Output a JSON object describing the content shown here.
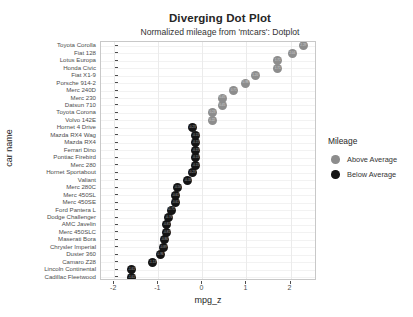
{
  "chart_data": {
    "type": "scatter",
    "title": "Diverging Dot Plot",
    "subtitle": "Normalized mileage from 'mtcars': Dotplot",
    "xlabel": "mpg_z",
    "ylabel": "car name",
    "xlim": [
      -2.3,
      2.6
    ],
    "grid": true,
    "legend": {
      "title": "Mileage",
      "position": "right",
      "entries": [
        {
          "label": "Above Average",
          "color": "#8d8d8d",
          "key": "above"
        },
        {
          "label": "Below Average",
          "color": "#141414",
          "key": "below"
        }
      ]
    },
    "xticks": [
      -2,
      -1,
      0,
      1,
      2
    ],
    "xtick_labels": [
      "-2",
      "-1",
      "0",
      "1",
      "2"
    ],
    "categories": [
      "Cadillac Fleetwood",
      "Lincoln Continental",
      "Camaro Z28",
      "Duster 360",
      "Chrysler Imperial",
      "Maserati Bora",
      "Merc 450SLC",
      "AMC Javelin",
      "Dodge Challenger",
      "Ford Pantera L",
      "Merc 450SE",
      "Merc 450SL",
      "Merc 280C",
      "Valiant",
      "Hornet Sportabout",
      "Merc 280",
      "Pontiac Firebird",
      "Ferrari Dino",
      "Mazda RX4",
      "Mazda RX4 Wag",
      "Hornet 4 Drive",
      "Volvo 142E",
      "Toyota Corona",
      "Datsun 710",
      "Merc 230",
      "Merc 240D",
      "Porsche 914-2",
      "Fiat X1-9",
      "Honda Civic",
      "Lotus Europa",
      "Fiat 128",
      "Toyota Corolla"
    ],
    "values": [
      -1.61,
      -1.61,
      -1.13,
      -0.96,
      -0.89,
      -0.86,
      -0.81,
      -0.81,
      -0.76,
      -0.71,
      -0.61,
      -0.61,
      -0.56,
      -0.33,
      -0.23,
      -0.15,
      -0.15,
      -0.15,
      -0.15,
      -0.15,
      -0.23,
      0.22,
      0.23,
      0.45,
      0.45,
      0.71,
      0.98,
      1.2,
      1.71,
      1.71,
      2.04,
      2.29
    ],
    "point_colors": [
      "below",
      "below",
      "below",
      "below",
      "below",
      "below",
      "below",
      "below",
      "below",
      "below",
      "below",
      "below",
      "below",
      "below",
      "below",
      "below",
      "below",
      "below",
      "below",
      "below",
      "below",
      "above",
      "above",
      "above",
      "above",
      "above",
      "above",
      "above",
      "above",
      "above",
      "above",
      "above"
    ]
  }
}
